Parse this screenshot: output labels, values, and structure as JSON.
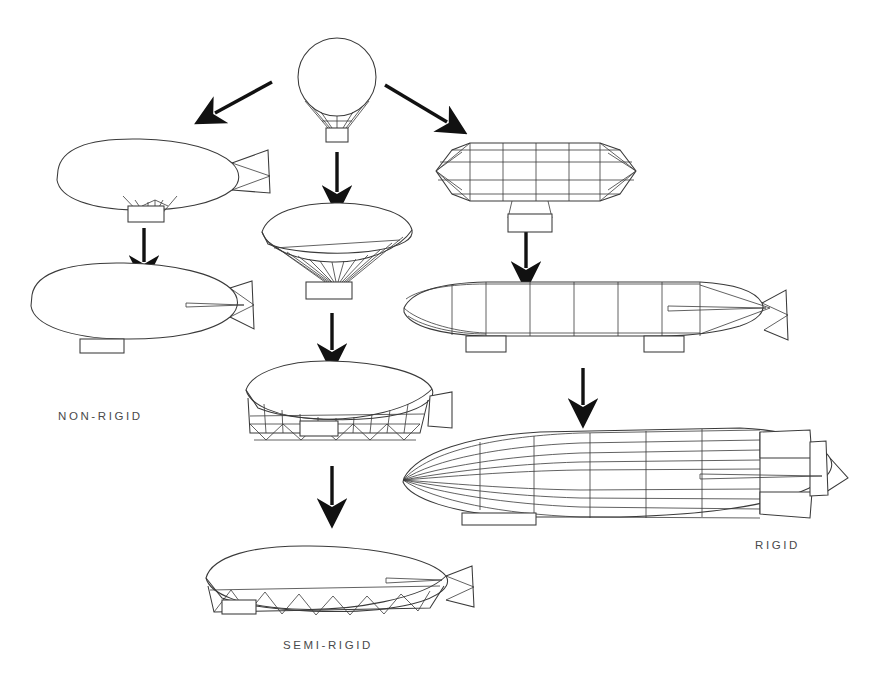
{
  "figure": {
    "background_color": "#ffffff",
    "line_color": "#3a3a3a",
    "arrow_color": "#111111"
  },
  "labels": [
    {
      "id": "non-rigid",
      "text": "NON-RIGID"
    },
    {
      "id": "rigid",
      "text": "RIGID"
    },
    {
      "id": "semi-rigid",
      "text": "SEMI-RIGID"
    }
  ],
  "branches": [
    {
      "name": "non-rigid",
      "stages": [
        {
          "order": 1,
          "name": "early-pressure-airship",
          "features": "teardrop envelope, external suspension rigging, slung car, pointed tail cone"
        },
        {
          "order": 2,
          "name": "modern-blimp",
          "features": "smooth envelope, integral gondola, cruciform tail fins"
        }
      ]
    },
    {
      "name": "semi-rigid",
      "stages": [
        {
          "order": 1,
          "name": "elongated-balloon",
          "features": "lens-shaped envelope with fan of many suspension cords to a single car"
        },
        {
          "order": 2,
          "name": "keel-airship",
          "features": "envelope with rigid lattice keel and zigzag truss along lower edge"
        },
        {
          "order": 3,
          "name": "mature-semi-rigid",
          "features": "streamlined hull with full-length triangulated keel girder and tail fins"
        }
      ]
    },
    {
      "name": "rigid",
      "stages": [
        {
          "order": 1,
          "name": "faceted-framework-airship",
          "features": "cylindrical faceted hull, visible ring-and-stringer framework, pointed nose and tail, single car"
        },
        {
          "order": 2,
          "name": "early-zeppelin",
          "features": "rounded hull, seven transverse frames, twin gondolas, boxed tail surfaces"
        },
        {
          "order": 3,
          "name": "large-zeppelin",
          "features": "streamlined hull, longitudinal stringers and transverse rings, cruciform tail, control car"
        }
      ]
    }
  ],
  "source_craft": {
    "name": "spherical-balloon",
    "features": "round gas bag, net rigging converging to a small basket"
  },
  "flow_arrows": [
    {
      "id": "balloon-to-nonrigid",
      "direction": "down-left"
    },
    {
      "id": "balloon-to-semirigid",
      "direction": "down"
    },
    {
      "id": "balloon-to-rigid",
      "direction": "down-right"
    },
    {
      "id": "nonrigid-1-to-2",
      "direction": "down"
    },
    {
      "id": "semirigid-1-to-2",
      "direction": "down"
    },
    {
      "id": "semirigid-2-to-3",
      "direction": "down"
    },
    {
      "id": "rigid-1-to-2",
      "direction": "down"
    },
    {
      "id": "rigid-2-to-3",
      "direction": "down"
    }
  ]
}
